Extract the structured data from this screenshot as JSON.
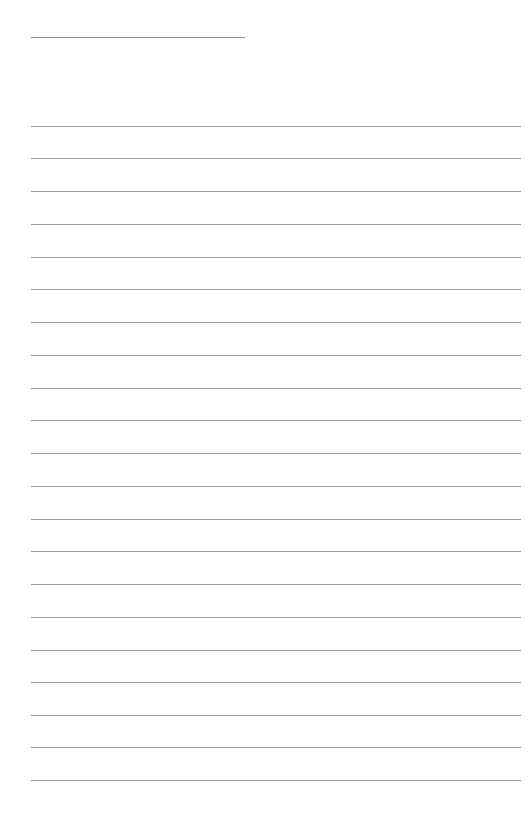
{
  "page": {
    "width": 528,
    "height": 828,
    "background_color": "#ffffff",
    "content_text": "",
    "is_blank": "true"
  },
  "style": {
    "rule_color": "#9d9da1",
    "header_rule_color": "#8e8e93",
    "rule_thickness": 1,
    "left_margin": 31,
    "right_margin": 521,
    "line_spacing": 32.65
  },
  "header_rule": {
    "label": "header rule",
    "x": 31,
    "y": 37,
    "width": 214
  },
  "body_rules": [
    {
      "label": "ruled line 1",
      "y": 126,
      "x": 31,
      "width": 490
    },
    {
      "label": "ruled line 2",
      "y": 158,
      "x": 31,
      "width": 490
    },
    {
      "label": "ruled line 3",
      "y": 191,
      "x": 31,
      "width": 490
    },
    {
      "label": "ruled line 4",
      "y": 224,
      "x": 31,
      "width": 490
    },
    {
      "label": "ruled line 5",
      "y": 257,
      "x": 31,
      "width": 490
    },
    {
      "label": "ruled line 6",
      "y": 289,
      "x": 31,
      "width": 490
    },
    {
      "label": "ruled line 7",
      "y": 322,
      "x": 31,
      "width": 490
    },
    {
      "label": "ruled line 8",
      "y": 355,
      "x": 31,
      "width": 490
    },
    {
      "label": "ruled line 9",
      "y": 388,
      "x": 31,
      "width": 490
    },
    {
      "label": "ruled line 10",
      "y": 420,
      "x": 31,
      "width": 490
    },
    {
      "label": "ruled line 11",
      "y": 453,
      "x": 31,
      "width": 490
    },
    {
      "label": "ruled line 12",
      "y": 486,
      "x": 31,
      "width": 490
    },
    {
      "label": "ruled line 13",
      "y": 519,
      "x": 31,
      "width": 490
    },
    {
      "label": "ruled line 14",
      "y": 551,
      "x": 31,
      "width": 490
    },
    {
      "label": "ruled line 15",
      "y": 584,
      "x": 31,
      "width": 490
    },
    {
      "label": "ruled line 16",
      "y": 617,
      "x": 31,
      "width": 490
    },
    {
      "label": "ruled line 17",
      "y": 650,
      "x": 31,
      "width": 490
    },
    {
      "label": "ruled line 18",
      "y": 682,
      "x": 31,
      "width": 490
    },
    {
      "label": "ruled line 19",
      "y": 715,
      "x": 31,
      "width": 490
    },
    {
      "label": "ruled line 20",
      "y": 747,
      "x": 31,
      "width": 490
    },
    {
      "label": "ruled line 21",
      "y": 780,
      "x": 31,
      "width": 490
    }
  ]
}
